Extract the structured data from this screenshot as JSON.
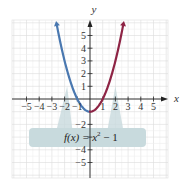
{
  "chart_data": {
    "type": "line",
    "title": "",
    "function_label": "f(x) = x² − 1",
    "xlabel": "x",
    "ylabel": "y",
    "xlim": [
      -6,
      6
    ],
    "ylim": [
      -6,
      6
    ],
    "grid": true,
    "x_ticks": [
      -5,
      -4,
      -3,
      -2,
      -1,
      1,
      2,
      3,
      4,
      5
    ],
    "y_ticks": [
      -5,
      -4,
      -2,
      1,
      2,
      3,
      4,
      5
    ],
    "series": [
      {
        "name": "left branch",
        "color": "#4a78b0",
        "x": [
          -2.6,
          -2,
          -1,
          0
        ],
        "y": [
          5.76,
          3,
          0,
          -1
        ]
      },
      {
        "name": "right branch",
        "color": "#8e2445",
        "x": [
          0,
          1,
          2,
          2.6
        ],
        "y": [
          -1,
          0,
          3,
          5.76
        ]
      }
    ],
    "vertex": {
      "x": 0,
      "y": -1
    },
    "annotation": {
      "text": "f(x) = x² − 1",
      "box_color": "#c8dadd"
    }
  },
  "labels": {
    "x_axis": "x",
    "y_axis": "y",
    "function": "f(x) = x",
    "exponent": "2",
    "tail": " − 1"
  }
}
